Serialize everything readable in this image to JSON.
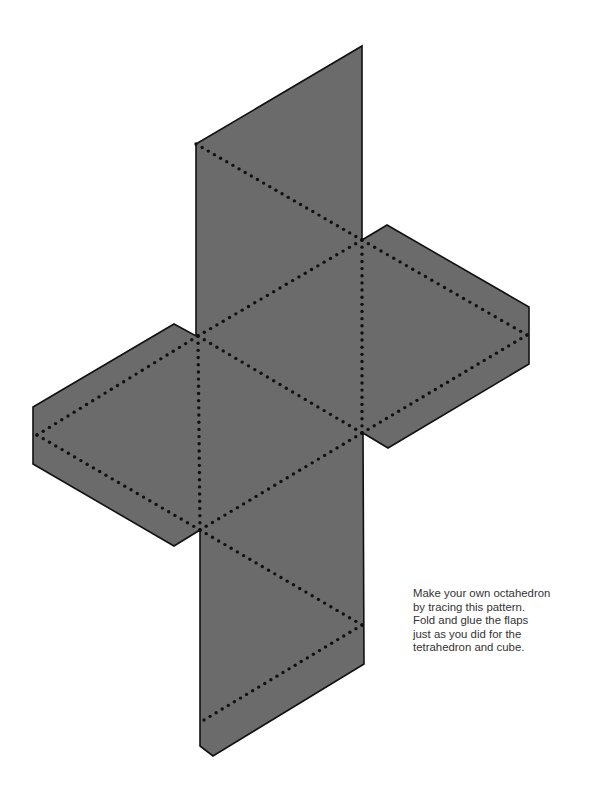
{
  "figure": {
    "colors": {
      "fill": "#6b6b6b",
      "outline": "#111111",
      "fold_dots": "#111111",
      "background": "#ffffff"
    },
    "outline_points": [
      [
        196,
        144
      ],
      [
        362,
        46
      ],
      [
        362,
        240
      ],
      [
        387,
        225
      ],
      [
        529,
        307
      ],
      [
        529,
        364
      ],
      [
        388,
        448
      ],
      [
        363,
        433
      ],
      [
        364,
        664
      ],
      [
        213,
        756
      ],
      [
        200,
        746
      ],
      [
        200,
        530
      ],
      [
        174,
        546
      ],
      [
        33,
        464
      ],
      [
        33,
        407
      ],
      [
        174,
        324
      ],
      [
        196,
        336
      ]
    ],
    "fold_lines": [
      [
        [
          196,
          144
        ],
        [
          362,
          240
        ]
      ],
      [
        [
          362,
          240
        ],
        [
          198,
          336
        ]
      ],
      [
        [
          198,
          336
        ],
        [
          362,
          433
        ]
      ],
      [
        [
          362,
          433
        ],
        [
          200,
          530
        ]
      ],
      [
        [
          200,
          530
        ],
        [
          362,
          625
        ]
      ],
      [
        [
          362,
          625
        ],
        [
          204,
          720
        ]
      ],
      [
        [
          198,
          336
        ],
        [
          200,
          530
        ]
      ],
      [
        [
          362,
          240
        ],
        [
          362,
          433
        ]
      ],
      [
        [
          362,
          240
        ],
        [
          527,
          335
        ]
      ],
      [
        [
          527,
          335
        ],
        [
          362,
          433
        ]
      ],
      [
        [
          198,
          336
        ],
        [
          37,
          435
        ]
      ],
      [
        [
          37,
          435
        ],
        [
          200,
          530
        ]
      ]
    ]
  },
  "caption": {
    "lines": [
      "Make your own octahedron",
      "by tracing this pattern.",
      "Fold and glue the flaps",
      "just as you did for the",
      "tetrahedron and cube."
    ]
  }
}
